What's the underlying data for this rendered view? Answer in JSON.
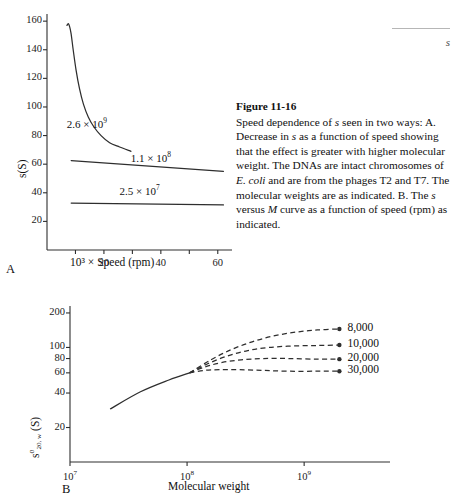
{
  "header": {
    "running_text": "s"
  },
  "caption": {
    "title": "Figure 11-16",
    "body": "Speed dependence of s seen in two ways: A. Decrease in s as a function of speed showing that the effect is greater with higher molecular weight. The DNAs are intact chromosomes of E. coli and are from the phages T2 and T7. The molecular weights are as indicated. B. The s versus M curve as a function of speed (rpm) as indicated."
  },
  "chart_data": [
    {
      "id": "panel-a",
      "type": "line",
      "panel_letter": "A",
      "title": "",
      "xlabel": "10³ × Speed (rpm)",
      "ylabel": "s(S)",
      "xlim": [
        0,
        65
      ],
      "ylim": [
        0,
        165
      ],
      "xticks": [
        10,
        20,
        30,
        40,
        50,
        60
      ],
      "xtick_labels": [
        "",
        "20",
        "",
        "40",
        "",
        "60"
      ],
      "yticks": [
        20,
        40,
        60,
        80,
        100,
        120,
        140,
        160
      ],
      "ytick_labels": [
        "20",
        "40",
        "60",
        "80",
        "100",
        "120",
        "140",
        "160"
      ],
      "grid": false,
      "legend": "inline-annotations",
      "series": [
        {
          "name": "2.6 × 10⁹",
          "label_html": "2.6 &#215; 10<sup>9</sup>",
          "style": "solid",
          "points": [
            [
              7.0,
              157
            ],
            [
              7.6,
              158
            ],
            [
              8.4,
              152
            ],
            [
              9.2,
              140
            ],
            [
              10.2,
              126
            ],
            [
              11.4,
              113
            ],
            [
              12.8,
              102
            ],
            [
              14.5,
              93
            ],
            [
              16.5,
              86
            ],
            [
              19.0,
              80
            ],
            [
              22.0,
              75
            ],
            [
              25.5,
              72
            ],
            [
              29.5,
              69
            ]
          ]
        },
        {
          "name": "1.1 × 10⁸",
          "label_html": "1.1 &#215; 10<sup>8</sup>",
          "style": "solid",
          "points": [
            [
              8.5,
              62.5
            ],
            [
              62.0,
              55.0
            ]
          ]
        },
        {
          "name": "2.5 × 10⁷",
          "label_html": "2.5 &#215; 10<sup>7</sup>",
          "style": "solid",
          "points": [
            [
              8.5,
              32.8
            ],
            [
              62.0,
              31.5
            ]
          ]
        }
      ],
      "annotations": [
        {
          "text": "2.6 × 10⁹",
          "x": 17.5,
          "y": 88
        },
        {
          "text": "1.1 × 10⁸",
          "x": 40.0,
          "y": 64
        },
        {
          "text": "2.5 × 10⁷",
          "x": 36.0,
          "y": 41
        }
      ]
    },
    {
      "id": "panel-b",
      "type": "line",
      "panel_letter": "B",
      "title": "",
      "xlabel": "Molecular weight",
      "ylabel": "s°₂₀,w (S)",
      "xscale": "log",
      "yscale": "log",
      "xlim": [
        10000000.0,
        3000000000.0
      ],
      "ylim": [
        10,
        230
      ],
      "xticks": [
        10000000.0,
        100000000.0,
        1000000000.0
      ],
      "xtick_labels": [
        "10⁷",
        "10⁸",
        "10⁹"
      ],
      "yticks": [
        20,
        40,
        60,
        80,
        100,
        200
      ],
      "ytick_labels": [
        "20",
        "40",
        "60",
        "80",
        "100",
        "200"
      ],
      "grid": false,
      "legend": "right-end-labels",
      "common_branch": {
        "style": "solid",
        "points": [
          [
            22000000.0,
            29
          ],
          [
            40000000.0,
            41
          ],
          [
            70000000.0,
            52
          ],
          [
            105000000.0,
            60
          ]
        ]
      },
      "series": [
        {
          "name": "8,000",
          "style": "dashed",
          "end_marker": "arrow",
          "points": [
            [
              105000000.0,
              60
            ],
            [
              160000000.0,
              78
            ],
            [
              240000000.0,
              96
            ],
            [
              360000000.0,
              112
            ],
            [
              550000000.0,
              126
            ],
            [
              850000000.0,
              136
            ],
            [
              1300000000.0,
              142
            ],
            [
              2000000000.0,
              145
            ]
          ]
        },
        {
          "name": "10,000",
          "style": "dashed",
          "end_marker": "arrow",
          "points": [
            [
              105000000.0,
              60
            ],
            [
              150000000.0,
              72
            ],
            [
              220000000.0,
              84
            ],
            [
              330000000.0,
              94
            ],
            [
              500000000.0,
              100
            ],
            [
              800000000.0,
              103
            ],
            [
              1300000000.0,
              104
            ],
            [
              2000000000.0,
              105
            ]
          ]
        },
        {
          "name": "20,000",
          "style": "dashed",
          "end_marker": "arrow",
          "points": [
            [
              105000000.0,
              60
            ],
            [
              145000000.0,
              68
            ],
            [
              200000000.0,
              74
            ],
            [
              290000000.0,
              78
            ],
            [
              450000000.0,
              80
            ],
            [
              750000000.0,
              80
            ],
            [
              1300000000.0,
              79
            ],
            [
              2000000000.0,
              79
            ]
          ]
        },
        {
          "name": "30,000",
          "style": "dashed",
          "end_marker": "arrow",
          "points": [
            [
              105000000.0,
              60
            ],
            [
              140000000.0,
              63
            ],
            [
              190000000.0,
              64
            ],
            [
              280000000.0,
              64
            ],
            [
              450000000.0,
              63
            ],
            [
              750000000.0,
              62
            ],
            [
              1300000000.0,
              62
            ],
            [
              2000000000.0,
              62
            ]
          ]
        }
      ],
      "end_labels": [
        "8,000",
        "10,000",
        "20,000",
        "30,000"
      ]
    }
  ],
  "colors": {
    "ink": "#2e2e2e",
    "text": "#111111",
    "rule": "#b6b6b6"
  }
}
